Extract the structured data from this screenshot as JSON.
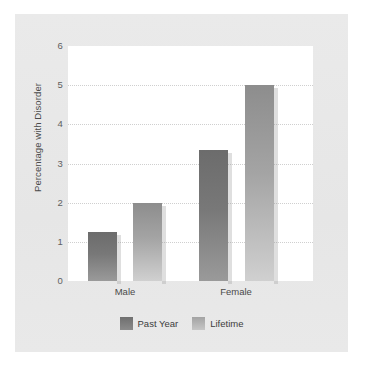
{
  "chart_data": {
    "type": "bar",
    "title": "",
    "xlabel": "",
    "ylabel": "Percentage with Disorder",
    "categories": [
      "Male",
      "Female"
    ],
    "series": [
      {
        "name": "Past Year",
        "values": [
          1.25,
          3.35
        ],
        "color": "#787878"
      },
      {
        "name": "Lifetime",
        "values": [
          2.0,
          5.0
        ],
        "color": "#a4a4a4"
      }
    ],
    "ylim": [
      0,
      6
    ],
    "yticks": [
      "0",
      "1",
      "2",
      "3",
      "4",
      "5",
      "6"
    ],
    "grid": true,
    "legend_position": "bottom"
  },
  "legend": {
    "entries": [
      {
        "label": "Past Year",
        "swatch": "past-year-swatch"
      },
      {
        "label": "Lifetime",
        "swatch": "lifetime-swatch"
      }
    ]
  },
  "colors": {
    "panel_background": "#e8e8e8",
    "plot_background": "#ffffff",
    "gridline": "#cfcfcf",
    "past_year_bar": "#787878",
    "lifetime_bar": "#a4a4a4",
    "text": "#4a4a4a"
  }
}
